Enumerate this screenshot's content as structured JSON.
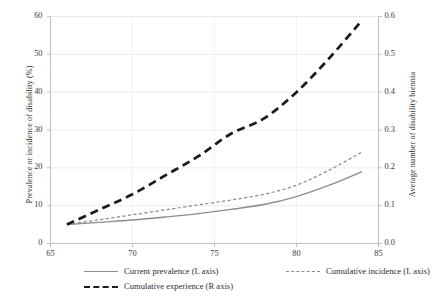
{
  "chart_data": {
    "type": "line",
    "title": "",
    "xlabel": "",
    "ylabel": "Prevalence or incidence of disability (%)",
    "y2label": "Average number of disability biennia",
    "xlim": [
      65,
      85
    ],
    "ylim": [
      0,
      60
    ],
    "y2lim": [
      0.0,
      0.6
    ],
    "xticks": [
      "65",
      "70",
      "75",
      "80",
      "85"
    ],
    "yticks": [
      "0",
      "10",
      "20",
      "30",
      "40",
      "50",
      "60"
    ],
    "y2ticks": [
      "0.0",
      "0.1",
      "0.2",
      "0.3",
      "0.4",
      "0.5",
      "0.6"
    ],
    "grid": "horizontal and vertical light gridlines",
    "legend_position": "below axes, two rows",
    "x": [
      66,
      68,
      70,
      72,
      74,
      76,
      78,
      80,
      82,
      84
    ],
    "series": [
      {
        "name": "Current prevalence (L axis)",
        "axis": "left",
        "style": "solid",
        "color": "#8c8c8c",
        "values": [
          5.0,
          5.6,
          6.2,
          7.0,
          7.9,
          9.0,
          10.3,
          12.4,
          15.4,
          19.0
        ]
      },
      {
        "name": "Cumulative incidence (L axis)",
        "axis": "left",
        "style": "dashed-thin",
        "color": "#8c8c8c",
        "values": [
          5.0,
          6.3,
          7.6,
          8.9,
          10.2,
          11.5,
          13.0,
          15.4,
          19.4,
          24.2
        ]
      },
      {
        "name": "Cumulative experience (R axis)",
        "axis": "right",
        "style": "dashed-thick",
        "color": "#1b1b1b",
        "values": [
          0.05,
          0.09,
          0.13,
          0.18,
          0.23,
          0.29,
          0.33,
          0.4,
          0.49,
          0.59
        ]
      }
    ]
  },
  "axes": {
    "left_title": "Prevalence or incidence of disability (%)",
    "right_title": "Average number of disability biennia"
  },
  "legend": {
    "items": [
      {
        "label": "Current prevalence (L axis)",
        "marker": "solid-line-swatch"
      },
      {
        "label": "Cumulative incidence (L axis)",
        "marker": "dashed-thin-line-swatch"
      },
      {
        "label": "Cumulative experience (R axis)",
        "marker": "dashed-thick-line-swatch"
      }
    ]
  },
  "colors": {
    "gray_series": "#8c8c8c",
    "black_series": "#1b1b1b",
    "grid": "#e9e9e9",
    "frame": "#bfbfbf"
  }
}
